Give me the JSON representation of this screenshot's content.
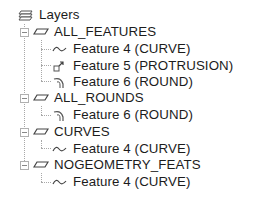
{
  "tree": {
    "root": {
      "label": "Layers",
      "icon": "layers-icon"
    },
    "layers": [
      {
        "label": "ALL_FEATURES",
        "expanded": true,
        "children": [
          {
            "label": "Feature 4 (CURVE)",
            "icon": "curve-icon"
          },
          {
            "label": "Feature 5 (PROTRUSION)",
            "icon": "protrusion-icon"
          },
          {
            "label": "Feature 6 (ROUND)",
            "icon": "round-icon"
          }
        ]
      },
      {
        "label": "ALL_ROUNDS",
        "expanded": true,
        "children": [
          {
            "label": "Feature 6 (ROUND)",
            "icon": "round-icon"
          }
        ]
      },
      {
        "label": "CURVES",
        "expanded": true,
        "children": [
          {
            "label": "Feature 4 (CURVE)",
            "icon": "curve-icon"
          }
        ]
      },
      {
        "label": "NOGEOMETRY_FEATS",
        "expanded": true,
        "children": [
          {
            "label": "Feature 4 (CURVE)",
            "icon": "curve-icon"
          }
        ]
      }
    ]
  }
}
